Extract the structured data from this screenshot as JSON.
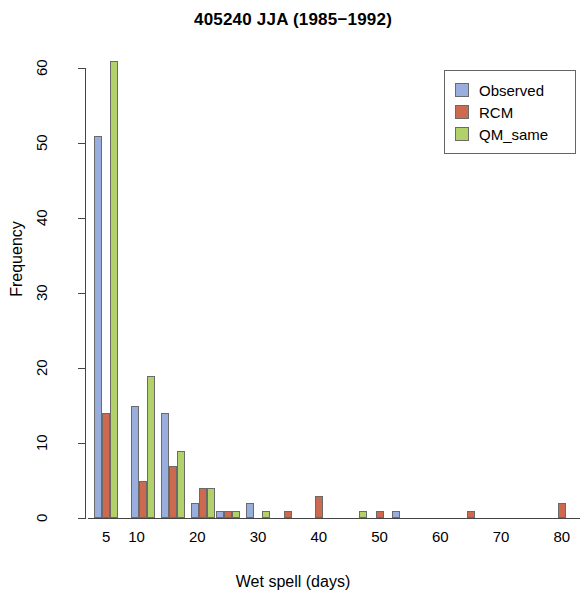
{
  "chart_data": {
    "type": "bar",
    "title": "405240 JJA (1985−1992)",
    "xlabel": "Wet spell (days)",
    "ylabel": "Frequency",
    "xlim": [
      2,
      83
    ],
    "ylim": [
      0,
      62
    ],
    "grid": false,
    "legend_position": "top-right",
    "x_ticks": [
      5,
      10,
      20,
      30,
      40,
      50,
      60,
      70,
      80
    ],
    "x_tick_labels": [
      "5",
      "10",
      "20",
      "30",
      "40",
      "50",
      "60",
      "70",
      "80"
    ],
    "y_ticks": [
      0,
      10,
      20,
      30,
      40,
      50,
      60
    ],
    "y_tick_labels": [
      "0",
      "10",
      "20",
      "30",
      "40",
      "50",
      "60"
    ],
    "categories": [
      5,
      11,
      16,
      21,
      25,
      30,
      35,
      40,
      46,
      50,
      54,
      65,
      80
    ],
    "series": [
      {
        "name": "Observed",
        "color": "#9aaede",
        "values": [
          51,
          15,
          14,
          2,
          1,
          2,
          0,
          0,
          0,
          0,
          1,
          0,
          0
        ]
      },
      {
        "name": "RCM",
        "color": "#cb6a4f",
        "values": [
          14,
          5,
          7,
          4,
          1,
          0,
          1,
          3,
          0,
          1,
          0,
          1,
          2
        ]
      },
      {
        "name": "QM_same",
        "color": "#b2d16a",
        "values": [
          61,
          19,
          9,
          4,
          1,
          1,
          0,
          0,
          1,
          0,
          0,
          0,
          0
        ]
      }
    ]
  },
  "legend": {
    "entries": [
      {
        "label": "Observed",
        "color": "#9aaede"
      },
      {
        "label": "RCM",
        "color": "#cb6a4f"
      },
      {
        "label": "QM_same",
        "color": "#b2d16a"
      }
    ]
  }
}
